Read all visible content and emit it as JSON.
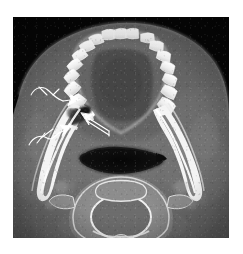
{
  "figure": {
    "modality": "CT",
    "view": "axial",
    "anatomy": "mandible-and-oropharynx",
    "caption": "",
    "background_color": "#ffffff",
    "scan_background_color": "#050505",
    "annotation_color": "#ffffff",
    "soft_tissue_color": "#6e6e6e",
    "bone_color": "#f2f2f2",
    "airway_color": "#0a0a0a",
    "lesion_color": "#1d1d1d"
  },
  "scan": {
    "frame": {
      "x": 13,
      "y": 17,
      "width": 216,
      "height": 221
    },
    "regions": [
      {
        "name": "right-mandibular-body",
        "label": ""
      },
      {
        "name": "left-mandibular-body",
        "label": ""
      },
      {
        "name": "dental-arch",
        "label": ""
      },
      {
        "name": "oropharyngeal-airway",
        "label": ""
      },
      {
        "name": "cervical-vertebra",
        "label": ""
      },
      {
        "name": "lesion",
        "label": ""
      }
    ],
    "teeth_count_right": 8,
    "teeth_count_left": 8
  },
  "annotations": {
    "count": 3,
    "color": "#ffffff",
    "markers": [
      {
        "name": "arrow-upper",
        "tip_x": 68,
        "tip_y": 82,
        "direction": "right-down",
        "style": "curved-tail-arrow"
      },
      {
        "name": "arrow-lower",
        "tip_x": 60,
        "tip_y": 110,
        "direction": "right-up",
        "style": "curved-tail-arrow"
      },
      {
        "name": "arrow-right",
        "tip_x": 68,
        "tip_y": 98,
        "direction": "up-left",
        "style": "straight-arrow"
      }
    ]
  }
}
